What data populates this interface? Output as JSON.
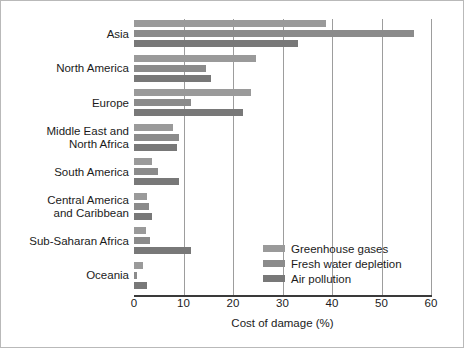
{
  "chart_data": {
    "type": "bar",
    "orientation": "horizontal",
    "title": "",
    "xlabel": "Cost of damage (%)",
    "ylabel": "",
    "xlim": [
      0,
      60
    ],
    "xticks": [
      0,
      10,
      20,
      30,
      40,
      50,
      60
    ],
    "xtick_labels": [
      "0",
      "10",
      "20",
      "30",
      "40",
      "50",
      "60"
    ],
    "grid": "vertical",
    "legend_position": "inside-lower-right",
    "categories": [
      "Asia",
      "North America",
      "Europe",
      "Middle East and\nNorth Africa",
      "South America",
      "Central America\nand Caribbean",
      "Sub-Saharan Africa",
      "Oceania"
    ],
    "series": [
      {
        "name": "Greenhouse gases",
        "color": "#9a9a9a",
        "values": [
          38.8,
          24.6,
          23.6,
          7.9,
          3.6,
          2.7,
          2.4,
          1.8
        ]
      },
      {
        "name": "Fresh water depletion",
        "color": "#8b8b8b",
        "values": [
          56.6,
          14.5,
          11.5,
          9.1,
          4.8,
          3.0,
          3.2,
          0.7
        ]
      },
      {
        "name": "Air pollution",
        "color": "#787878",
        "values": [
          33.1,
          15.6,
          22.0,
          8.6,
          9.1,
          3.6,
          11.5,
          2.7
        ]
      }
    ]
  },
  "legend": {
    "items": [
      {
        "label": "Greenhouse gases",
        "color": "#9a9a9a"
      },
      {
        "label": "Fresh water depletion",
        "color": "#8b8b8b"
      },
      {
        "label": "Air pollution",
        "color": "#787878"
      }
    ]
  },
  "axis": {
    "x_title": "Cost of damage (%)"
  },
  "colors": {
    "gridline": "#9d9d9d",
    "axis": "#3a3a3a",
    "text": "#1b1b1b",
    "background": "#ffffff",
    "frame": "#b9b9b9"
  }
}
